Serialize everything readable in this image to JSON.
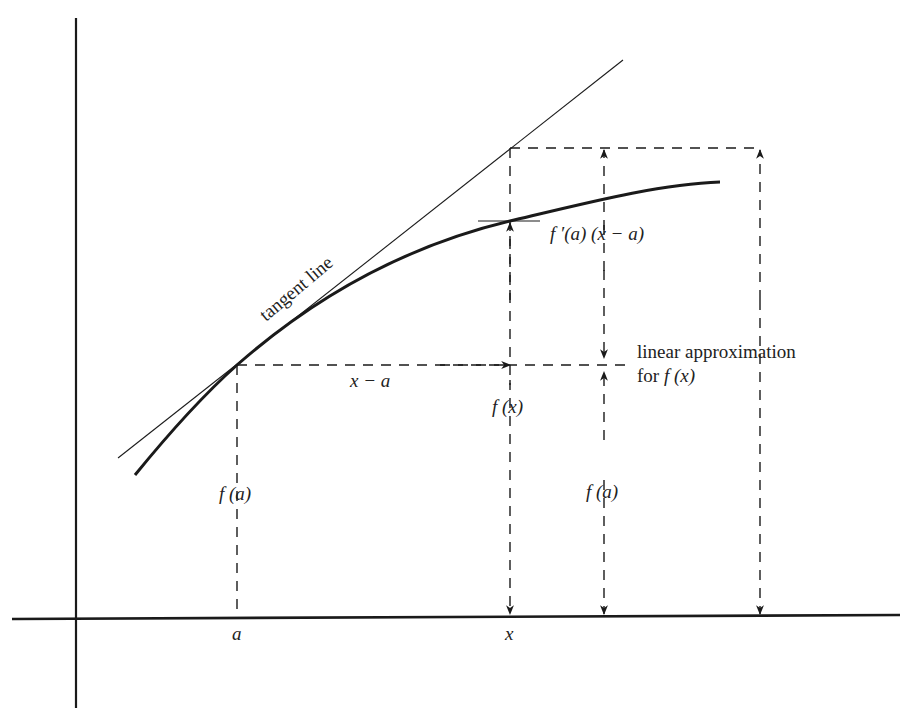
{
  "diagram": {
    "colors": {
      "ink": "#1a1a1a",
      "background": "#ffffff"
    },
    "labels": {
      "tangent_line": "tangent line",
      "x_minus_a": "x − a",
      "derivative_term": "f ′(a) (x − a)",
      "f_x": "f (x)",
      "f_a_left": "f (a)",
      "f_a_right": "f (a)",
      "linear_approx_line1": "linear approximation",
      "linear_approx_line2_prefix": "for ",
      "linear_approx_line2_func": "f (x)",
      "axis_tick_a": "a",
      "axis_tick_x": "x"
    },
    "points": {
      "tangent_point": {
        "label": "(a, f(a))",
        "px": [
          237,
          365
        ]
      },
      "curve_at_x": {
        "label": "(x, f(x))",
        "px": [
          510,
          221
        ]
      },
      "tangent_at_x": {
        "label": "(x, f(a)+f'(a)(x-a))",
        "px": [
          510,
          148
        ]
      }
    },
    "elements": [
      "y-axis",
      "x-axis",
      "curve f",
      "tangent line at a",
      "dashed guide lines",
      "dimension arrows"
    ]
  }
}
